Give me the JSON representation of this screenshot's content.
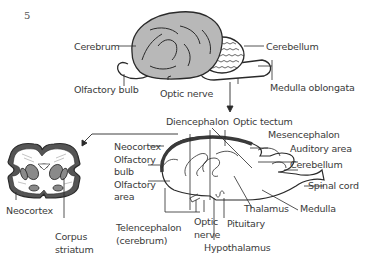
{
  "figure_number": "5",
  "top_view": {
    "labels": {
      "cerebrum": "Cerebrum",
      "cerebellum": "Cerebellum",
      "olfactory_bulb": "Olfactory bulb",
      "optic_nerve": "Optic nerve",
      "medulla_oblongata": "Medulla oblongata"
    }
  },
  "cross_section": {
    "labels": {
      "neocortex": "Neocortex",
      "corpus_striatum_line1": "Corpus",
      "corpus_striatum_line2": "striatum"
    }
  },
  "sagittal_view": {
    "labels": {
      "diencephalon": "Diencephalon",
      "optic_tectum": "Optic tectum",
      "neocortex": "Neocortex",
      "olfactory_bulb_line1": "Olfactory",
      "olfactory_bulb_line2": "bulb",
      "olfactory_area_line1": "Olfactory",
      "olfactory_area_line2": "area",
      "mesencephalon": "Mesencephalon",
      "auditory_area": "Auditory area",
      "cerebellum": "Cerebellum",
      "spinal_cord": "Spinal cord",
      "medulla": "Medulla",
      "thalamus": "Thalamus",
      "pituitary": "Pituitary",
      "optic_nerve_line1": "Optic",
      "optic_nerve_line2": "nerve",
      "hypothalamus": "Hypothalamus",
      "telencephalon_line1": "Telencephalon",
      "telencephalon_line2": "(cerebrum)"
    }
  },
  "colors": {
    "cerebrum_fill": "#b8b8b8",
    "line": "#2a2a2a",
    "neocortex_band": "#555555",
    "striatum_fill": "#8a8a8a"
  }
}
